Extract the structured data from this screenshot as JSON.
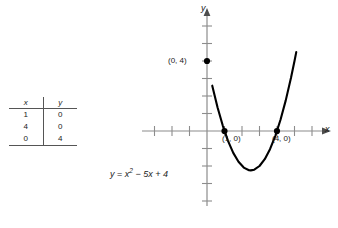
{
  "figure": {
    "type": "coordinate-graph-with-table",
    "equation": {
      "lhs": "y",
      "eq": " = ",
      "base": "x",
      "exponent": "2",
      "rest": " − 5x + 4",
      "full": "y = x² − 5x + 4"
    },
    "curve_color": "#000000",
    "axis_color": "#8c8c8c",
    "text_color": "#1a1a1a"
  },
  "table": {
    "headers": [
      "x",
      "y"
    ],
    "rows": [
      [
        "1",
        "0"
      ],
      [
        "4",
        "0"
      ],
      [
        "0",
        "4"
      ]
    ]
  },
  "axes": {
    "x_label": "x",
    "y_label": "y",
    "x_range": [
      -3.8,
      5.6
    ],
    "y_range": [
      -4.4,
      6.4
    ],
    "tick_spacing": 1,
    "origin_px": [
      207,
      131
    ],
    "unit_px": 17.5,
    "grid": false
  },
  "points": [
    {
      "label": "(0, 4)",
      "x": 0,
      "y": 4,
      "marker": "filled-dot"
    },
    {
      "label": "(1, 0)",
      "x": 1,
      "y": 0,
      "marker": "filled-dot"
    },
    {
      "label": "(4, 0)",
      "x": 4,
      "y": 0,
      "marker": "filled-dot"
    }
  ],
  "chart_data": {
    "type": "line",
    "title": "",
    "xlabel": "x",
    "ylabel": "y",
    "equation": "y = x^2 - 5x + 4",
    "vertex": [
      2.5,
      -2.25
    ],
    "roots": [
      1,
      4
    ],
    "y_intercept": 4,
    "xlim": [
      -3.8,
      5.6
    ],
    "ylim": [
      -4.4,
      6.4
    ],
    "grid": false,
    "series": [
      {
        "name": "y = x^2 - 5x + 4",
        "x": [
          0.3,
          0.6,
          0.9,
          1.2,
          1.5,
          1.8,
          2.1,
          2.4,
          2.5,
          2.7,
          3.0,
          3.3,
          3.6,
          3.9,
          4.2,
          4.5,
          4.8,
          5.0,
          5.1
        ],
        "y": [
          2.59,
          1.36,
          0.31,
          -0.56,
          -1.25,
          -1.76,
          -2.09,
          -2.24,
          -2.25,
          -2.21,
          -2.0,
          -1.61,
          -1.04,
          -0.29,
          0.64,
          1.75,
          3.04,
          4.0,
          4.51
        ]
      }
    ]
  }
}
